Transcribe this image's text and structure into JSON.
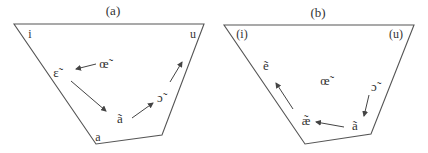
{
  "colors": {
    "line": "#555555",
    "text": "#333333",
    "background": "#ffffff"
  },
  "panels": [
    {
      "title": "(a)",
      "corners": {
        "top_left": "i",
        "top_right": "u",
        "bottom": "a"
      },
      "vowels": {
        "eps": "ε̃",
        "oe": "œ̃",
        "a": "ã",
        "open_o": "ɔ̃"
      },
      "arrows": [
        {
          "from": "œ̃",
          "to": "ε̃"
        },
        {
          "from": "ε̃",
          "to": "ã"
        },
        {
          "from": "ã",
          "to": "ɔ̃"
        },
        {
          "from": "ɔ̃",
          "to": "u"
        }
      ]
    },
    {
      "title": "(b)",
      "corners": {
        "top_left": "(i)",
        "top_right": "(u)"
      },
      "vowels": {
        "e": "ẽ",
        "oe": "œ̃",
        "open_o": "ɔ̃",
        "ae": "æ̃",
        "a": "ã"
      },
      "arrows": [
        {
          "from": "ɔ̃",
          "to": "ã"
        },
        {
          "from": "ã",
          "to": "æ̃"
        },
        {
          "from": "æ̃",
          "to": "ẽ"
        }
      ]
    }
  ]
}
